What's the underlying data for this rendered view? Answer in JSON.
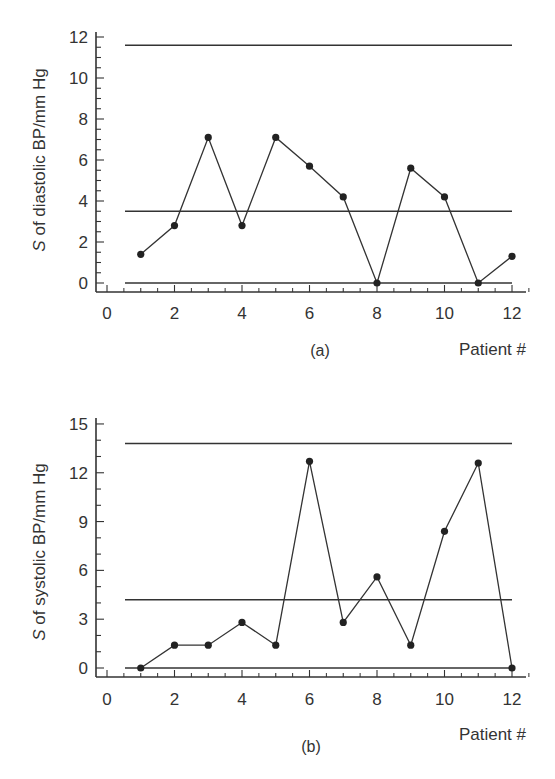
{
  "chart_data": [
    {
      "type": "line",
      "panel": "(a)",
      "title": "",
      "xlabel": "Patient #",
      "ylabel": "S of diastolic BP/mm Hg",
      "x": [
        1,
        2,
        3,
        4,
        5,
        6,
        7,
        8,
        9,
        10,
        11,
        12
      ],
      "series": [
        {
          "name": "S diastolic",
          "values": [
            1.4,
            2.8,
            7.1,
            2.8,
            7.1,
            5.7,
            4.2,
            0.0,
            5.6,
            4.2,
            0.0,
            1.3
          ]
        }
      ],
      "reference_lines": {
        "upper_limit": 11.6,
        "center_line": 3.5,
        "lower_limit": 0.0
      },
      "xticks": [
        "0",
        "2",
        "4",
        "6",
        "8",
        "10",
        "12"
      ],
      "yticks": [
        "0",
        "2",
        "4",
        "6",
        "8",
        "10",
        "12"
      ],
      "xlim": [
        0,
        12
      ],
      "ylim": [
        -0.4,
        12.3
      ],
      "grid": false,
      "legend": null
    },
    {
      "type": "line",
      "panel": "(b)",
      "title": "",
      "xlabel": "Patient #",
      "ylabel": "S of systolic BP/mm Hg",
      "x": [
        1,
        2,
        3,
        4,
        5,
        6,
        7,
        8,
        9,
        10,
        11,
        12
      ],
      "series": [
        {
          "name": "S systolic",
          "values": [
            0.0,
            1.4,
            1.4,
            2.8,
            1.4,
            12.7,
            2.8,
            5.6,
            1.4,
            8.4,
            12.6,
            0.0
          ]
        }
      ],
      "reference_lines": {
        "upper_limit": 13.8,
        "center_line": 4.2,
        "lower_limit": 0.0
      },
      "xticks": [
        "0",
        "2",
        "4",
        "6",
        "8",
        "10",
        "12"
      ],
      "yticks": [
        "0",
        "3",
        "6",
        "9",
        "12",
        "15"
      ],
      "xlim": [
        0,
        12
      ],
      "ylim": [
        -0.5,
        15.4
      ],
      "grid": false,
      "legend": null
    }
  ],
  "panels": {
    "a": {
      "label": "(a)",
      "xlabel": "Patient #",
      "ylabel_italic": "S",
      "ylabel_rest": " of diastolic BP/mm Hg"
    },
    "b": {
      "label": "(b)",
      "xlabel": "Patient #",
      "ylabel_italic": "S",
      "ylabel_rest": " of systolic BP/mm Hg"
    }
  },
  "colors": {
    "line": "#333333",
    "marker": "#222222",
    "axis": "#333333",
    "background": "#ffffff"
  }
}
